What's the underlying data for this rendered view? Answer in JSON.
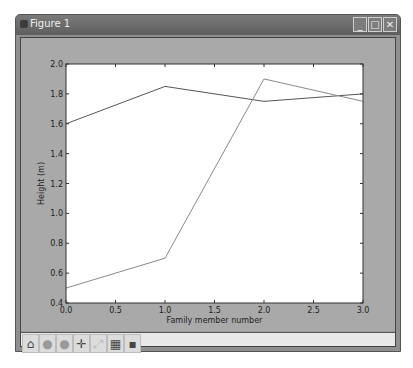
{
  "window": {
    "title": "Figure 1",
    "controls": [
      {
        "name": "minimize",
        "glyph": "_"
      },
      {
        "name": "maximize",
        "glyph": "□"
      },
      {
        "name": "close",
        "glyph": "✕"
      }
    ]
  },
  "toolbar": {
    "tools": [
      {
        "name": "home",
        "glyph": "⌂"
      },
      {
        "name": "back",
        "glyph": "●"
      },
      {
        "name": "forward",
        "glyph": "●"
      },
      {
        "name": "pan",
        "glyph": "✛"
      },
      {
        "name": "zoom-rect",
        "glyph": "⤢"
      },
      {
        "name": "subplots",
        "glyph": "▦"
      },
      {
        "name": "save",
        "glyph": "▪"
      }
    ]
  },
  "chart_data": {
    "type": "line",
    "title": "",
    "xlabel": "Family member number",
    "ylabel": "Height (m)",
    "xlim": [
      0.0,
      3.0
    ],
    "ylim": [
      0.4,
      2.0
    ],
    "xticks": [
      "0.0",
      "0.5",
      "1.0",
      "1.5",
      "2.0",
      "2.5",
      "3.0"
    ],
    "yticks": [
      "0.4",
      "0.6",
      "0.8",
      "1.0",
      "1.2",
      "1.4",
      "1.6",
      "1.8",
      "2.0"
    ],
    "grid": false,
    "legend": null,
    "x": [
      0,
      1,
      2,
      3
    ],
    "series": [
      {
        "name": "series-1",
        "values": [
          1.6,
          1.85,
          1.75,
          1.8
        ],
        "color": "#555555"
      },
      {
        "name": "series-2",
        "values": [
          0.5,
          0.7,
          1.9,
          1.75
        ],
        "color": "#8a8a8a"
      }
    ]
  }
}
